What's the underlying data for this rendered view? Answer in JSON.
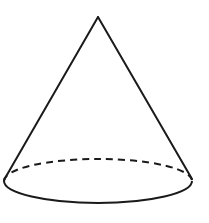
{
  "diagram": {
    "type": "geometric-solid",
    "shape": "cone",
    "stroke_color": "#1a1a1a",
    "background": "#ffffff",
    "apex": {
      "x": 98,
      "y": 17
    },
    "base": {
      "cx": 98,
      "cy": 182,
      "rx": 95,
      "ry": 22,
      "front_arc": "solid",
      "back_arc": "dashed"
    },
    "sides": [
      {
        "from": "apex",
        "to": {
          "x": 4,
          "y": 180
        }
      },
      {
        "from": "apex",
        "to": {
          "x": 192,
          "y": 179
        }
      }
    ]
  }
}
